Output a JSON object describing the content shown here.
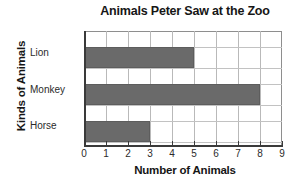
{
  "chart_data": {
    "type": "bar",
    "orientation": "horizontal",
    "title": "Animals Peter Saw at the Zoo",
    "xlabel": "Number of Animals",
    "ylabel": "Kinds of Animals",
    "categories": [
      "Lion",
      "Monkey",
      "Horse"
    ],
    "values": [
      5,
      8,
      3
    ],
    "xlim": [
      0,
      9
    ],
    "xticks": [
      "0",
      "1",
      "2",
      "3",
      "4",
      "5",
      "6",
      "7",
      "8",
      "9"
    ],
    "grid": true,
    "legend": null,
    "bar_color": "#6a6a6a",
    "grid_color": "#b9b9b9",
    "axis_color": "#3a3a3a",
    "background": "#ffffff"
  }
}
